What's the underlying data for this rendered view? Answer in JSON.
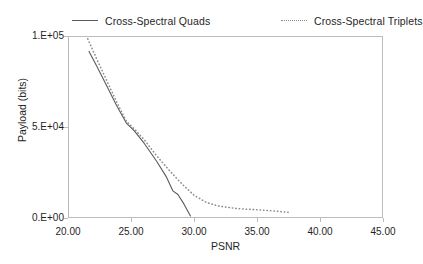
{
  "chart_data": {
    "type": "line",
    "title": "",
    "xlabel": "PSNR",
    "ylabel": "Payload (bits)",
    "xlim": [
      20.0,
      45.0
    ],
    "ylim": [
      0,
      100000
    ],
    "xticks": [
      "20.00",
      "25.00",
      "30.00",
      "35.00",
      "40.00",
      "45.00"
    ],
    "xtick_values": [
      20.0,
      25.0,
      30.0,
      35.0,
      40.0,
      45.0
    ],
    "yticks": [
      "0.E+00",
      "5.E+04",
      "1.E+05"
    ],
    "ytick_values": [
      0,
      50000,
      100000
    ],
    "grid": false,
    "legend_position": "top",
    "series": [
      {
        "name": "Cross-Spectral Quads",
        "style": "solid",
        "color": "#5a5a5a",
        "points": [
          [
            21.6,
            92000
          ],
          [
            22.2,
            84000
          ],
          [
            23.0,
            73000
          ],
          [
            23.8,
            62000
          ],
          [
            24.6,
            52000
          ],
          [
            25.2,
            48000
          ],
          [
            26.0,
            41000
          ],
          [
            27.0,
            31000
          ],
          [
            27.8,
            22000
          ],
          [
            28.3,
            14500
          ],
          [
            28.7,
            12500
          ],
          [
            29.2,
            7000
          ],
          [
            29.7,
            600
          ]
        ]
      },
      {
        "name": "Cross-Spectral Triplets",
        "style": "dotted",
        "color": "#8c8c8c",
        "points": [
          [
            21.5,
            99000
          ],
          [
            22.2,
            88000
          ],
          [
            23.0,
            76000
          ],
          [
            23.8,
            64000
          ],
          [
            24.6,
            53000
          ],
          [
            25.2,
            49000
          ],
          [
            26.0,
            43000
          ],
          [
            27.0,
            34000
          ],
          [
            28.0,
            26000
          ],
          [
            29.0,
            18500
          ],
          [
            30.0,
            12000
          ],
          [
            31.0,
            8000
          ],
          [
            32.0,
            6000
          ],
          [
            33.5,
            4600
          ],
          [
            35.0,
            4000
          ],
          [
            36.3,
            3400
          ],
          [
            37.5,
            2600
          ]
        ]
      }
    ]
  },
  "legend": {
    "entries": [
      {
        "label": "Cross-Spectral Quads"
      },
      {
        "label": "Cross-Spectral Triplets"
      }
    ]
  }
}
